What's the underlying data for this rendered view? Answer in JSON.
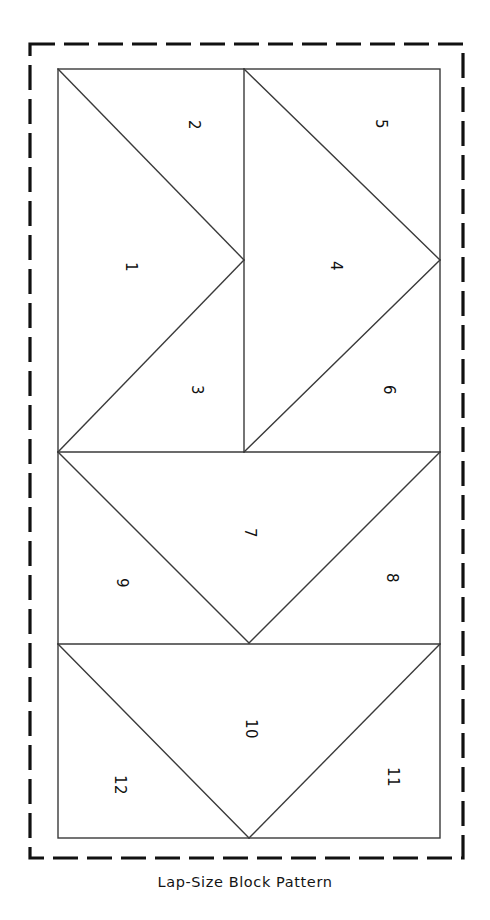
{
  "page": {
    "width": 490,
    "height": 920,
    "background_color": "#ffffff",
    "ink_color": "#1a1a1a",
    "line_color": "#3a3a3a"
  },
  "cut_border": {
    "name": "dashed-cutting-guide",
    "style": "dashed",
    "x": 30,
    "y": 44,
    "width": 433,
    "height": 814,
    "stroke_width": 3.2,
    "dash": "25 9",
    "color": "#111111"
  },
  "block_outline": {
    "name": "block-outline",
    "x": 58,
    "y": 69,
    "width": 382,
    "height": 769,
    "stroke_width": 1.4,
    "color": "#3a3a3a"
  },
  "grid": {
    "vertical_divider_x": 244,
    "horizontal_divider_1_y": 452,
    "horizontal_divider_2_y": 644,
    "bottom_y": 838,
    "top_y": 69,
    "left_x": 58,
    "right_x": 440
  },
  "caption": {
    "text": "Lap-Size Block Pattern",
    "x": 245,
    "y": 887
  },
  "pieces": [
    {
      "number": "1",
      "x": 130,
      "y": 267,
      "rotation": 90
    },
    {
      "number": "2",
      "x": 193,
      "y": 125,
      "rotation": 90
    },
    {
      "number": "3",
      "x": 196,
      "y": 390,
      "rotation": 90
    },
    {
      "number": "4",
      "x": 335,
      "y": 266,
      "rotation": 90
    },
    {
      "number": "5",
      "x": 380,
      "y": 124,
      "rotation": 90
    },
    {
      "number": "6",
      "x": 388,
      "y": 390,
      "rotation": 90
    },
    {
      "number": "7",
      "x": 249,
      "y": 533,
      "rotation": 90
    },
    {
      "number": "8",
      "x": 391,
      "y": 578,
      "rotation": 90
    },
    {
      "number": "9",
      "x": 121,
      "y": 583,
      "rotation": 90
    },
    {
      "number": "10",
      "x": 250,
      "y": 729,
      "rotation": 90
    },
    {
      "number": "11",
      "x": 392,
      "y": 777,
      "rotation": 90
    },
    {
      "number": "12",
      "x": 119,
      "y": 785,
      "rotation": 90
    }
  ],
  "seam_lines": [
    {
      "name": "top-left-upper-diagonal",
      "x1": 58,
      "y1": 69,
      "x2": 244,
      "y2": 260
    },
    {
      "name": "top-left-lower-diagonal",
      "x1": 244,
      "y1": 260,
      "x2": 58,
      "y2": 452
    },
    {
      "name": "top-right-upper-diagonal",
      "x1": 244,
      "y1": 69,
      "x2": 440,
      "y2": 260
    },
    {
      "name": "top-right-lower-diagonal",
      "x1": 440,
      "y1": 260,
      "x2": 244,
      "y2": 452
    },
    {
      "name": "top-center-vertical",
      "x1": 244,
      "y1": 69,
      "x2": 244,
      "y2": 452
    },
    {
      "name": "middle-left-diagonal",
      "x1": 58,
      "y1": 452,
      "x2": 249,
      "y2": 643
    },
    {
      "name": "middle-right-diagonal",
      "x1": 249,
      "y1": 643,
      "x2": 440,
      "y2": 452
    },
    {
      "name": "bottom-left-diagonal",
      "x1": 58,
      "y1": 644,
      "x2": 249,
      "y2": 838
    },
    {
      "name": "bottom-right-diagonal",
      "x1": 249,
      "y1": 838,
      "x2": 440,
      "y2": 644
    },
    {
      "name": "divider-upper-horizontal",
      "x1": 58,
      "y1": 452,
      "x2": 440,
      "y2": 452
    },
    {
      "name": "divider-lower-horizontal",
      "x1": 58,
      "y1": 644,
      "x2": 440,
      "y2": 644
    }
  ]
}
